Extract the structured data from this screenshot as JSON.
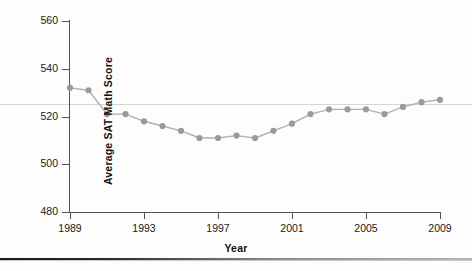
{
  "figure": {
    "background_color": "#fdfdfd",
    "axis_color": "#555555",
    "marker_color": "#9a9a9a",
    "line_color": "#b0b0b0",
    "artifact_line_color": "#d5d5d5"
  },
  "chart_data": {
    "type": "line",
    "title": "",
    "xlabel": "Year",
    "ylabel": "Average SAT Math Score",
    "xlim": [
      1989,
      2009
    ],
    "ylim": [
      480,
      560
    ],
    "ytick_labels": [
      "480",
      "500",
      "520",
      "540",
      "560"
    ],
    "yticks": [
      480,
      500,
      520,
      540,
      560
    ],
    "xtick_labels": [
      "1989",
      "1993",
      "1997",
      "2001",
      "2005",
      "2009"
    ],
    "xticks": [
      1989,
      1993,
      1997,
      2001,
      2005,
      2009
    ],
    "grid": false,
    "legend": "none",
    "marker": "circle",
    "x": [
      1989,
      1990,
      1991,
      1992,
      1993,
      1994,
      1995,
      1996,
      1997,
      1998,
      1999,
      2000,
      2001,
      2002,
      2003,
      2004,
      2005,
      2006,
      2007,
      2008,
      2009
    ],
    "values": [
      532,
      531,
      521,
      521,
      518,
      516,
      514,
      511,
      511,
      512,
      511,
      514,
      517,
      521,
      523,
      523,
      523,
      521,
      524,
      526,
      527
    ],
    "series": [
      {
        "name": "Average SAT Math Score",
        "values": [
          532,
          531,
          521,
          521,
          518,
          516,
          514,
          511,
          511,
          512,
          511,
          514,
          517,
          521,
          523,
          523,
          523,
          521,
          524,
          526,
          527
        ]
      }
    ]
  }
}
